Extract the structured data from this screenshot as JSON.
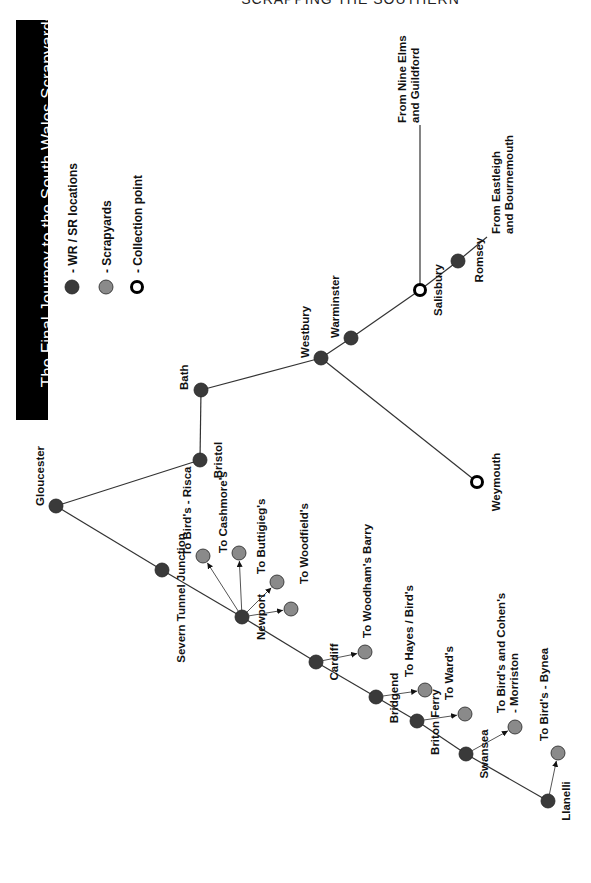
{
  "header": {
    "text": "SCRAPPING THE SOUTHERN"
  },
  "title": "The Final Journey to the South Wales Scrapyards",
  "colors": {
    "wr_sr": "#3a3a3a",
    "scrapyard": "#8a8a8a",
    "collection": "#000000",
    "line": "#333333"
  },
  "legend": [
    {
      "type": "wr_sr",
      "label": "- WR / SR locations",
      "x": 72,
      "y": 287
    },
    {
      "type": "scrapyard",
      "label": "- Scrapyards",
      "x": 106,
      "y": 287
    },
    {
      "type": "collection",
      "label": "- Collection point",
      "x": 137,
      "y": 287
    }
  ],
  "nodes": [
    {
      "id": "gloucester",
      "name": "Gloucester",
      "type": "wr_sr",
      "x": 56,
      "y": 506,
      "lx": 44,
      "ly": 506,
      "anchor": "start"
    },
    {
      "id": "bristol",
      "name": "Bristol",
      "type": "wr_sr",
      "x": 200,
      "y": 460,
      "lx": 222,
      "ly": 460,
      "anchor": "end"
    },
    {
      "id": "bath",
      "name": "Bath",
      "type": "wr_sr",
      "x": 201,
      "y": 390,
      "lx": 188,
      "ly": 390,
      "anchor": "start"
    },
    {
      "id": "westbury",
      "name": "Westbury",
      "type": "wr_sr",
      "x": 321,
      "y": 358,
      "lx": 309,
      "ly": 358,
      "anchor": "start"
    },
    {
      "id": "warminster",
      "name": "Warminster",
      "type": "wr_sr",
      "x": 351,
      "y": 338,
      "lx": 339,
      "ly": 338,
      "anchor": "start"
    },
    {
      "id": "salisbury",
      "name": "Salisbury",
      "type": "collection",
      "x": 420,
      "y": 290,
      "lx": 442,
      "ly": 290,
      "anchor": "end"
    },
    {
      "id": "romsey",
      "name": "Romsey",
      "type": "wr_sr",
      "x": 458,
      "y": 261,
      "lx": 483,
      "ly": 260,
      "anchor": "end"
    },
    {
      "id": "weymouth",
      "name": "Weymouth",
      "type": "collection",
      "x": 477,
      "y": 482,
      "lx": 500,
      "ly": 482,
      "anchor": "end"
    },
    {
      "id": "severn",
      "name": "Severn Tunnel Junction",
      "type": "wr_sr",
      "x": 162,
      "y": 570,
      "lx": 185,
      "ly": 598,
      "anchor": "end"
    },
    {
      "id": "newport",
      "name": "Newport",
      "type": "wr_sr",
      "x": 242,
      "y": 617,
      "lx": 265,
      "ly": 617,
      "anchor": "end"
    },
    {
      "id": "cardiff",
      "name": "Cardiff",
      "type": "wr_sr",
      "x": 316,
      "y": 662,
      "lx": 338,
      "ly": 662,
      "anchor": "end"
    },
    {
      "id": "bridgend",
      "name": "Bridgend",
      "type": "wr_sr",
      "x": 376,
      "y": 697,
      "lx": 398,
      "ly": 698,
      "anchor": "end"
    },
    {
      "id": "briton_ferry",
      "name": "Briton Ferry",
      "type": "wr_sr",
      "x": 417,
      "y": 721,
      "lx": 439,
      "ly": 722,
      "anchor": "end"
    },
    {
      "id": "swansea",
      "name": "Swansea",
      "type": "wr_sr",
      "x": 466,
      "y": 754,
      "lx": 488,
      "ly": 754,
      "anchor": "end"
    },
    {
      "id": "llanelli",
      "name": "Llanelli",
      "type": "wr_sr",
      "x": 548,
      "y": 801,
      "lx": 570,
      "ly": 801,
      "anchor": "end"
    }
  ],
  "scrapyards": [
    {
      "id": "birds_risca",
      "name": "To Bird's - Risca",
      "from": "newport",
      "x": 203,
      "y": 556,
      "lx": 191,
      "ly": 556,
      "anchor": "start"
    },
    {
      "id": "cashmores",
      "name": "To Cashmore's",
      "from": "newport",
      "x": 239,
      "y": 553,
      "lx": 227,
      "ly": 553,
      "anchor": "start"
    },
    {
      "id": "buttigiegs",
      "name": "To Buttigieg's",
      "from": "newport",
      "x": 277,
      "y": 582,
      "lx": 265,
      "ly": 574,
      "anchor": "start"
    },
    {
      "id": "woodfields",
      "name": "To Woodfield's",
      "from": "newport",
      "x": 291,
      "y": 609,
      "lx": 308,
      "ly": 584,
      "anchor": "end"
    },
    {
      "id": "woodhams_barry",
      "name": "To Woodham's Barry",
      "from": "cardiff",
      "x": 365,
      "y": 652,
      "lx": 371,
      "ly": 638,
      "anchor": "start"
    },
    {
      "id": "hayes_birds",
      "name": "To Hayes / Bird's",
      "from": "bridgend",
      "x": 425,
      "y": 690,
      "lx": 413,
      "ly": 677,
      "anchor": "start"
    },
    {
      "id": "wards",
      "name": "To Ward's",
      "from": "briton_ferry",
      "x": 465,
      "y": 714,
      "lx": 453,
      "ly": 700,
      "anchor": "start"
    },
    {
      "id": "birds_cohens",
      "name": "To Bird's and Cohen's",
      "name2": "- Morriston",
      "from": "swansea",
      "x": 515,
      "y": 727,
      "lx": 505,
      "ly": 713,
      "anchor": "start"
    },
    {
      "id": "birds_bynea",
      "name": "To Bird's - Bynea",
      "from": "llanelli",
      "x": 558,
      "y": 753,
      "lx": 548,
      "ly": 741,
      "anchor": "start"
    }
  ],
  "lines": [
    [
      "gloucester",
      "bristol"
    ],
    [
      "bristol",
      "bath"
    ],
    [
      "bath",
      "westbury"
    ],
    [
      "westbury",
      "warminster"
    ],
    [
      "warminster",
      "salisbury"
    ],
    [
      "salisbury",
      "romsey"
    ],
    [
      "westbury",
      "weymouth"
    ],
    [
      "gloucester",
      "severn"
    ],
    [
      "severn",
      "newport"
    ],
    [
      "newport",
      "cardiff"
    ],
    [
      "cardiff",
      "bridgend"
    ],
    [
      "bridgend",
      "briton_ferry"
    ],
    [
      "briton_ferry",
      "swansea"
    ],
    [
      "swansea",
      "llanelli"
    ]
  ],
  "feeds": [
    {
      "id": "nine_elms",
      "label1": "From Nine Elms",
      "label2": "and Guildford",
      "x1": 420,
      "y1": 290,
      "x2": 420,
      "y2": 125,
      "lx": 406,
      "ly": 123
    },
    {
      "id": "eastleigh",
      "label1": "From Eastleigh",
      "label2": "and Bournemouth",
      "x1": 458,
      "y1": 261,
      "x2": 487,
      "y2": 237,
      "lx": 500,
      "ly": 234
    }
  ]
}
